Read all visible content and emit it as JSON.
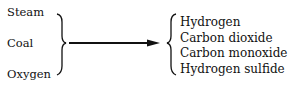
{
  "diagram": {
    "inputs": [
      "Steam",
      "Coal",
      "Oxygen"
    ],
    "outputs": [
      "Hydrogen",
      "Carbon dioxide",
      "Carbon monoxide",
      "Hydrogen sulfide"
    ],
    "connector": "arrow-right"
  }
}
